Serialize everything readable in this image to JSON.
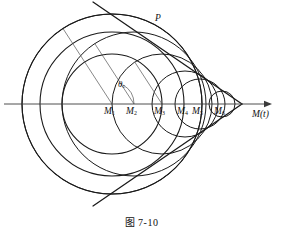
{
  "figure": {
    "caption": "图 7-10",
    "caption_x": 0,
    "caption_y": 214,
    "width": 283,
    "height": 233,
    "background": "#ffffff",
    "stroke_color": "#1a1a1a",
    "thin_stroke_color": "#555555"
  },
  "axis": {
    "label": "M(t)",
    "label_x": 252,
    "label_y": 110,
    "y": 104,
    "x_start": 4,
    "x_end": 272,
    "arrow": "right-arrow"
  },
  "angle": {
    "label": "θ",
    "subscript": "c",
    "label_x": 118,
    "label_y": 80,
    "value_deg": 33
  },
  "point_p": {
    "label": "P",
    "label_x": 155,
    "label_y": 14
  },
  "cone": {
    "apex_x": 242,
    "apex_y": 104,
    "half_angle_deg": 33,
    "upper_line": {
      "x1": 93,
      "y1": 2,
      "x2": 242,
      "y2": 104
    },
    "lower_line": {
      "x1": 93,
      "y1": 206,
      "x2": 242,
      "y2": 104
    }
  },
  "sources": [
    {
      "label": "M",
      "sub": "1",
      "cx": 112,
      "cy": 104,
      "r": 90,
      "label_x": 104,
      "label_y": 107,
      "radius_line": true
    },
    {
      "label": "M",
      "sub": "2",
      "cx": 134,
      "cy": 104,
      "r": 72,
      "label_x": 126,
      "label_y": 107,
      "radius_line": true
    },
    {
      "label": "M",
      "sub": "3",
      "cx": 162,
      "cy": 104,
      "r": 50,
      "label_x": 154,
      "label_y": 107,
      "radius_line": true
    },
    {
      "label": "M",
      "sub": "4",
      "cx": 185,
      "cy": 104,
      "r": 33,
      "label_x": 177,
      "label_y": 107,
      "radius_line": false
    },
    {
      "label": "M",
      "sub": "5",
      "cx": 200,
      "cy": 104,
      "r": 25,
      "label_x": 192,
      "label_y": 107,
      "radius_line": false
    },
    {
      "label": "M",
      "sub": "6",
      "cx": 222,
      "cy": 104,
      "r": 13,
      "label_x": 214,
      "label_y": 107,
      "radius_line": false
    }
  ],
  "outer_circles": [
    {
      "cx": 112,
      "cy": 104,
      "r": 90
    },
    {
      "cx": 112,
      "cy": 104,
      "r": 72
    },
    {
      "cx": 112,
      "cy": 104,
      "r": 50
    }
  ]
}
